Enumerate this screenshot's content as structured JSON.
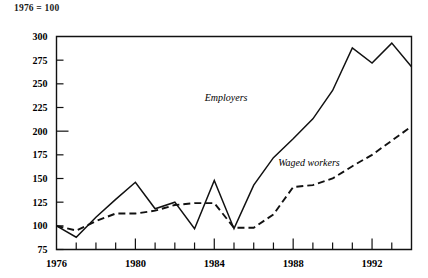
{
  "caption": "1976 = 100",
  "chart_data": {
    "type": "line",
    "title": "",
    "subtitle": "1976 = 100",
    "xlabel": "",
    "ylabel": "",
    "xlim": [
      1976,
      1994
    ],
    "ylim": [
      75,
      300
    ],
    "yticks": [
      75,
      100,
      125,
      150,
      175,
      200,
      225,
      250,
      275,
      300
    ],
    "ytick_labels": [
      "75",
      "100",
      "125",
      "150",
      "175",
      "200",
      "225",
      "250",
      "275",
      "300"
    ],
    "xticks": [
      1976,
      1977,
      1978,
      1979,
      1980,
      1981,
      1982,
      1983,
      1984,
      1985,
      1986,
      1987,
      1988,
      1989,
      1990,
      1991,
      1992,
      1993,
      1994
    ],
    "xtick_labels_shown": [
      "1976",
      "1980",
      "1984",
      "1988",
      "1992"
    ],
    "xtick_labels_shown_at": [
      1976,
      1980,
      1984,
      1988,
      1992
    ],
    "grid": false,
    "legend": "inline-annotations",
    "x": [
      1976,
      1977,
      1978,
      1979,
      1980,
      1981,
      1982,
      1983,
      1984,
      1985,
      1986,
      1987,
      1988,
      1989,
      1990,
      1991,
      1992,
      1993,
      1994
    ],
    "series": [
      {
        "name": "Employers",
        "style": "solid",
        "label_x": 1984.6,
        "label_y": 232,
        "values": [
          100,
          88,
          109,
          128,
          146,
          118,
          125,
          97,
          148,
          97,
          143,
          172,
          192,
          213,
          243,
          288,
          272,
          293,
          268
        ]
      },
      {
        "name": "Waged workers",
        "style": "dashed",
        "label_x": 1988.8,
        "label_y": 163,
        "values": [
          100,
          95,
          105,
          113,
          113,
          116,
          122,
          124,
          124,
          98,
          98,
          112,
          141,
          143,
          150,
          163,
          175,
          190,
          205
        ]
      }
    ],
    "annotations": [
      {
        "text": "Employers",
        "x": 1984.6,
        "y": 232
      },
      {
        "text": "Waged workers",
        "x": 1988.8,
        "y": 163
      }
    ]
  },
  "axis": {
    "y_tick_values": [
      "300",
      "275",
      "250",
      "225",
      "200",
      "175",
      "150",
      "125",
      "100",
      "75"
    ],
    "x_tick_values": [
      "1976",
      "1980",
      "1984",
      "1988",
      "1992"
    ]
  }
}
